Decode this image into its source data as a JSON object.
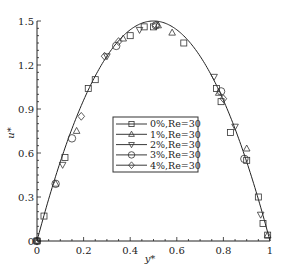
{
  "chart_data": {
    "type": "line",
    "title": "",
    "xlabel": "y*",
    "ylabel": "u*",
    "xlim": [
      0,
      1
    ],
    "ylim": [
      0,
      1.5
    ],
    "xticks": [
      0,
      0.2,
      0.4,
      0.6,
      0.8,
      1
    ],
    "xtick_labels": [
      "0",
      "0.2",
      "0.4",
      "0.6",
      "0.8",
      "1"
    ],
    "yticks": [
      0,
      0.3,
      0.6,
      0.9,
      1.2,
      1.5
    ],
    "ytick_labels": [
      "0",
      "0.3",
      "0.6",
      "0.9",
      "1.2",
      "1.5"
    ],
    "grid": false,
    "legend_position": "center-right",
    "analytic_curve": {
      "name": "analytic",
      "formula": "u* = 6 y*(1 - y*)",
      "peak": 1.5,
      "peak_at": 0.5
    },
    "series": [
      {
        "name": "0%,Re=30",
        "marker": "square",
        "x": [
          0.0,
          0.03,
          0.12,
          0.22,
          0.25,
          0.4,
          0.46,
          0.5,
          0.63,
          0.77,
          0.79,
          0.83,
          0.9,
          0.95,
          0.97,
          0.99
        ],
        "y": [
          0.0,
          0.17,
          0.57,
          1.04,
          1.1,
          1.4,
          1.46,
          1.46,
          1.35,
          1.04,
          0.95,
          0.74,
          0.55,
          0.3,
          0.12,
          0.04
        ]
      },
      {
        "name": "1%,Re=30",
        "marker": "triangle-up",
        "x": [
          0.0,
          0.08,
          0.17,
          0.37,
          0.52,
          0.58,
          0.78,
          0.9,
          0.99
        ],
        "y": [
          0.0,
          0.39,
          0.75,
          1.38,
          1.47,
          1.42,
          1.01,
          0.63,
          0.04
        ]
      },
      {
        "name": "2%,Re=30",
        "marker": "triangle-down",
        "x": [
          0.0,
          0.11,
          0.3,
          0.44,
          0.76,
          0.85,
          0.96
        ],
        "y": [
          0.0,
          0.52,
          1.26,
          1.44,
          1.12,
          0.78,
          0.18
        ]
      },
      {
        "name": "3%,Re=30",
        "marker": "circle",
        "x": [
          0.0,
          0.08,
          0.15,
          0.34,
          0.51,
          0.79,
          0.89
        ],
        "y": [
          0.0,
          0.39,
          0.7,
          1.33,
          1.47,
          1.02,
          0.56
        ]
      },
      {
        "name": "4%,Re=30",
        "marker": "diamond",
        "x": [
          0.0,
          0.19,
          0.29,
          0.35,
          0.51,
          0.8
        ],
        "y": [
          0.0,
          0.85,
          1.26,
          1.36,
          1.47,
          0.97
        ]
      }
    ]
  },
  "legend": {
    "items": [
      {
        "label": "0%,Re=30",
        "marker": "square"
      },
      {
        "label": "1%,Re=30",
        "marker": "triangle-up"
      },
      {
        "label": "2%,Re=30",
        "marker": "triangle-down"
      },
      {
        "label": "3%,Re=30",
        "marker": "circle"
      },
      {
        "label": "4%,Re=30",
        "marker": "diamond"
      }
    ]
  },
  "colors": {
    "line": "#222222",
    "marker": "#333333",
    "background": "#ffffff"
  }
}
